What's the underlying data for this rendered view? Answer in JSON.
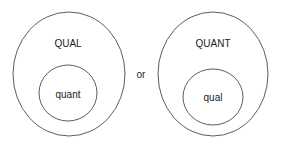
{
  "left": {
    "outer_label": "QUAL",
    "inner_label": "quant"
  },
  "connector": "or",
  "right": {
    "outer_label": "QUANT",
    "inner_label": "qual"
  },
  "colors": {
    "stroke": "#333333",
    "text": "#222222"
  }
}
